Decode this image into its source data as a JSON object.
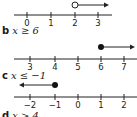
{
  "problems": [
    {
      "letter": "",
      "inequality": "",
      "ticks": [
        "0",
        "1",
        "2",
        "3"
      ],
      "point": "2",
      "point_type": "open",
      "direction": "right"
    },
    {
      "letter": "b",
      "inequality": "x ≥ 6",
      "ticks": [
        "3",
        "4",
        "5",
        "6",
        "7"
      ],
      "point": "6",
      "point_type": "closed",
      "direction": "right"
    },
    {
      "letter": "c",
      "inequality": "x ≤ −1",
      "ticks": [
        "−2",
        "−1",
        "0",
        "1",
        "2"
      ],
      "point": "−1",
      "point_type": "closed",
      "direction": "left"
    },
    {
      "letter": "d",
      "inequality": "x > 4",
      "ticks": [],
      "point": "",
      "point_type": "",
      "direction": ""
    }
  ]
}
